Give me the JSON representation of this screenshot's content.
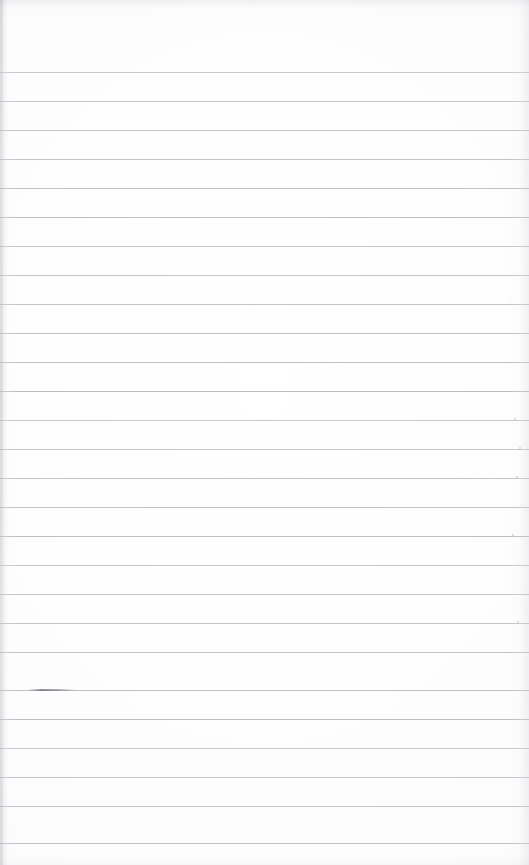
{
  "document": {
    "kind": "scanned-ruled-notebook-page",
    "page_width": 529,
    "page_height": 865,
    "background_color": "#fdfdfd",
    "paper_white": "#ffffff",
    "content_text": "",
    "has_handwriting": false,
    "has_printed_text": false
  },
  "ruling": {
    "line_color": "#b9bdc2",
    "line_thickness_px": 1,
    "line_spacing_px": 29,
    "first_line_y": 72,
    "last_line_y": 843,
    "line_count": 27,
    "left_inset_px": 0,
    "right_inset_px": 0,
    "margin_rule_present": false,
    "line_y_positions": [
      72,
      101,
      130,
      159,
      188,
      217,
      246,
      275,
      304,
      333,
      362,
      391,
      420,
      449,
      478,
      507,
      536,
      565,
      594,
      623,
      652,
      690,
      719,
      748,
      777,
      806,
      843
    ]
  },
  "margins": {
    "top_margin_height": 72,
    "top_margin_label": "blank top margin",
    "bottom_margin_height": 21,
    "bottom_margin_label": "blank bottom margin"
  },
  "artifacts": {
    "vignette_color": "#969ba2",
    "left_edge_streak": true,
    "smudges": [
      {
        "x": 28,
        "y": 689,
        "width": 48,
        "label": "ink smudge on rule"
      }
    ],
    "specks": [
      {
        "x": 514,
        "y": 418,
        "size": 2
      },
      {
        "x": 519,
        "y": 447,
        "size": 2
      },
      {
        "x": 516,
        "y": 476,
        "size": 2
      },
      {
        "x": 521,
        "y": 505,
        "size": 1
      },
      {
        "x": 512,
        "y": 534,
        "size": 2
      },
      {
        "x": 518,
        "y": 563,
        "size": 1
      },
      {
        "x": 509,
        "y": 299,
        "size": 1
      },
      {
        "x": 517,
        "y": 621,
        "size": 2
      }
    ]
  }
}
